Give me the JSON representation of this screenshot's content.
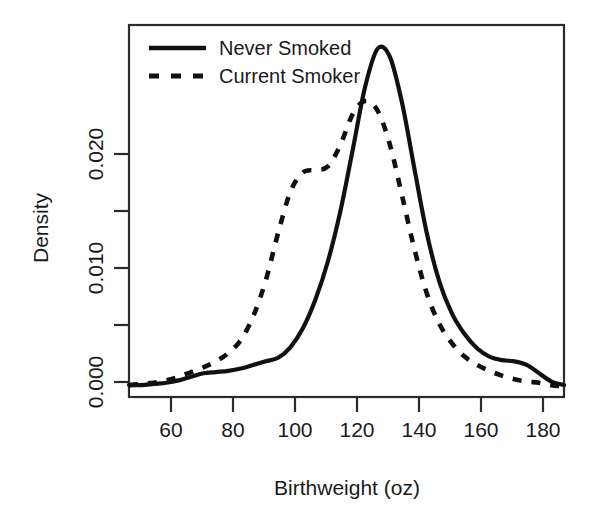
{
  "chart_data": {
    "type": "line",
    "title": "",
    "subtitle": "",
    "xlabel": "Birthweight (oz)",
    "ylabel": "Density",
    "xlim": [
      46,
      186
    ],
    "ylim": [
      -0.0008,
      0.0305
    ],
    "grid": false,
    "legend_position": "top-left",
    "xticks": [
      60,
      80,
      100,
      120,
      140,
      160,
      180
    ],
    "xtick_labels": [
      "60",
      "80",
      "100",
      "120",
      "140",
      "160",
      "180"
    ],
    "yticks": [
      0.0,
      0.005,
      0.01,
      0.015,
      0.02
    ],
    "ytick_labels": [
      "0.000",
      "",
      "0.010",
      "",
      "0.020"
    ],
    "ytick_labels_shown": [
      "0.000",
      "0.010",
      "0.020"
    ],
    "series": [
      {
        "name": "Never Smoked",
        "style": "solid",
        "color": "#111111",
        "x": [
          46,
          50,
          54,
          58,
          62,
          66,
          70,
          74,
          78,
          82,
          86,
          90,
          94,
          98,
          102,
          106,
          110,
          114,
          118,
          122,
          126,
          130,
          134,
          138,
          142,
          146,
          150,
          154,
          158,
          162,
          166,
          170,
          174,
          178,
          182,
          186
        ],
        "y": [
          0.0002,
          0.0002,
          0.0003,
          0.0004,
          0.0006,
          0.0009,
          0.0012,
          0.0013,
          0.0014,
          0.0016,
          0.0019,
          0.0022,
          0.0025,
          0.0034,
          0.005,
          0.0074,
          0.0106,
          0.0148,
          0.02,
          0.0253,
          0.0285,
          0.0278,
          0.0238,
          0.0182,
          0.0128,
          0.0088,
          0.0062,
          0.0045,
          0.0033,
          0.0026,
          0.0023,
          0.0022,
          0.0019,
          0.0012,
          0.0005,
          0.0002
        ]
      },
      {
        "name": "Current Smoker",
        "style": "dashed",
        "color": "#111111",
        "x": [
          46,
          50,
          54,
          58,
          62,
          66,
          70,
          74,
          78,
          82,
          86,
          90,
          94,
          98,
          102,
          106,
          110,
          114,
          118,
          122,
          126,
          130,
          134,
          138,
          142,
          146,
          150,
          154,
          158,
          162,
          166,
          170,
          174,
          178,
          182,
          186
        ],
        "y": [
          0.0002,
          0.0003,
          0.0004,
          0.0006,
          0.0009,
          0.0013,
          0.0017,
          0.0022,
          0.0029,
          0.004,
          0.006,
          0.009,
          0.013,
          0.0165,
          0.0181,
          0.0183,
          0.0186,
          0.0204,
          0.023,
          0.0241,
          0.0233,
          0.0204,
          0.016,
          0.0115,
          0.0078,
          0.0053,
          0.0037,
          0.0026,
          0.0019,
          0.0014,
          0.001,
          0.0007,
          0.0005,
          0.0004,
          0.0002,
          0.0001
        ]
      }
    ]
  },
  "legend": {
    "entries": [
      {
        "label": "Never Smoked",
        "style": "solid"
      },
      {
        "label": "Current Smoker",
        "style": "dashed"
      }
    ]
  },
  "axes": {
    "x_title": "Birthweight (oz)",
    "y_title": "Density",
    "x_tick_labels": [
      "60",
      "80",
      "100",
      "120",
      "140",
      "160",
      "180"
    ],
    "y_tick_labels": [
      "0.000",
      "0.010",
      "0.020"
    ]
  }
}
